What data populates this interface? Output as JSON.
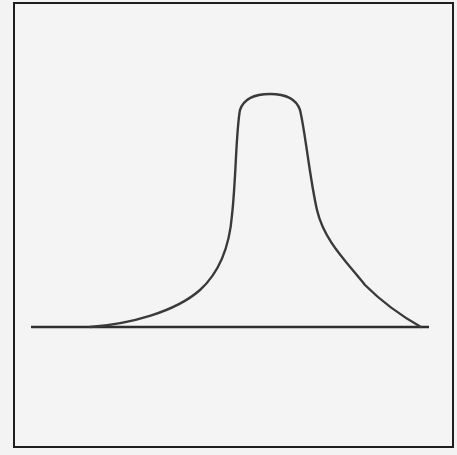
{
  "diagram": {
    "type": "skewed distribution curve",
    "stroke_color": "#3a3a3a",
    "border_color": "#1e1e1e",
    "background": "#f4f4f4",
    "baseline": {
      "x1": 31,
      "x2": 429,
      "y": 327
    },
    "curve_points": [
      {
        "x": 90,
        "y": 327
      },
      {
        "x": 180,
        "y": 290
      },
      {
        "x": 230,
        "y": 215
      },
      {
        "x": 238,
        "y": 115
      },
      {
        "x": 270,
        "y": 94
      },
      {
        "x": 302,
        "y": 115
      },
      {
        "x": 320,
        "y": 220
      },
      {
        "x": 421,
        "y": 327
      }
    ]
  }
}
